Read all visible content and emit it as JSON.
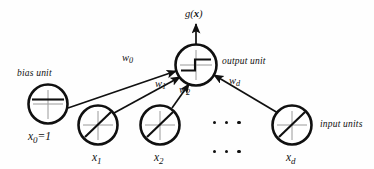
{
  "diagram": {
    "colors": {
      "stroke": "#101010",
      "axis": "#8d8d8d",
      "background": "#fefefe"
    },
    "output_label": {
      "text": "g(",
      "var": "x",
      "tail": ")"
    },
    "annotations": {
      "bias_unit": "bias unit",
      "output_unit": "output unit",
      "input_units": "input units"
    },
    "nodes": [
      {
        "id": "bias",
        "label_base": "x",
        "label_sub": "0",
        "label_tail": "=1",
        "cx": 48,
        "cy": 104,
        "r": 20,
        "glyph": "constant"
      },
      {
        "id": "x1",
        "label_base": "x",
        "label_sub": "1",
        "label_tail": "",
        "cx": 98,
        "cy": 125,
        "r": 20,
        "glyph": "identity"
      },
      {
        "id": "x2",
        "label_base": "x",
        "label_sub": "2",
        "label_tail": "",
        "cx": 160,
        "cy": 125,
        "r": 20,
        "glyph": "identity"
      },
      {
        "id": "xd",
        "label_base": "x",
        "label_sub": "d",
        "label_tail": "",
        "cx": 292,
        "cy": 125,
        "r": 20,
        "glyph": "identity"
      },
      {
        "id": "output",
        "label_base": "",
        "label_sub": "",
        "label_tail": "",
        "cx": 196,
        "cy": 65,
        "r": 21,
        "glyph": "step"
      }
    ],
    "weights": [
      {
        "id": "w0",
        "base": "w",
        "sub": "0",
        "x": 122,
        "y": 57
      },
      {
        "id": "w1",
        "base": "w",
        "sub": "1",
        "x": 157,
        "y": 83
      },
      {
        "id": "w2",
        "base": "w",
        "sub": "2",
        "x": 181,
        "y": 88
      },
      {
        "id": "wd",
        "base": "w",
        "sub": "d",
        "x": 231,
        "y": 80
      }
    ],
    "ellipsis": {
      "rows": 2,
      "dots_per_row": 3,
      "row1_y": 123,
      "row2_y": 152,
      "x": 213
    }
  }
}
